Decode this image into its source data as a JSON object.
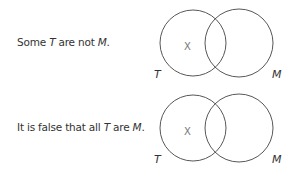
{
  "diagrams": [
    {
      "statement": {
        "pre": "Some ",
        "t": "T",
        "mid": " are not ",
        "m": "M",
        "post": "."
      },
      "left_label": "T",
      "right_label": "M",
      "mark": "X",
      "mark_region": "T only"
    },
    {
      "statement": {
        "pre": "It is false that all ",
        "t": "T",
        "mid": " are ",
        "m": "M",
        "post": "."
      },
      "left_label": "T",
      "right_label": "M",
      "mark": "X",
      "mark_region": "T only"
    }
  ],
  "colors": {
    "stroke": "#444444",
    "text": "#333333",
    "mark": "#777777"
  }
}
